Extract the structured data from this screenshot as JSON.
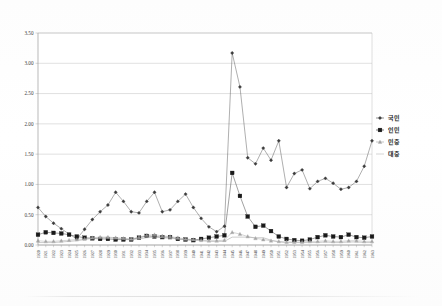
{
  "figure": {
    "title": "",
    "background_color": "#ffffff"
  },
  "axes": {
    "y_ticks": [
      "0.00",
      "0.50",
      "1.00",
      "1.50",
      "2.00",
      "2.50",
      "3.00",
      "3.50"
    ],
    "x_ticks": [
      "1920",
      "1921",
      "1922",
      "1923",
      "1924",
      "1925",
      "1926",
      "1927",
      "1928",
      "1929",
      "1930",
      "1931",
      "1932",
      "1933",
      "1934",
      "1935",
      "1936",
      "1937",
      "1938",
      "1939",
      "1940",
      "1941",
      "1942",
      "1943",
      "1944",
      "1945",
      "1946",
      "1947",
      "1948",
      "1949",
      "1950",
      "1951",
      "1952",
      "1953",
      "1954",
      "1955",
      "1956",
      "1957",
      "1958",
      "1959",
      "1960",
      "1961",
      "1962",
      "1963"
    ]
  },
  "legend": {
    "position": "right",
    "entries": [
      {
        "label": "국민",
        "marker": "diamond",
        "color": "#3c3c3c"
      },
      {
        "label": "인민",
        "marker": "square",
        "color": "#1a1a1a"
      },
      {
        "label": "민중",
        "marker": "triangle",
        "color": "#9a9a9a"
      },
      {
        "label": "대중",
        "marker": "line",
        "color": "#b4b4b4"
      }
    ]
  },
  "chart_data": {
    "type": "line",
    "title": "",
    "xlabel": "",
    "ylabel": "",
    "ylim": [
      0.0,
      3.5
    ],
    "ytick_step": 0.5,
    "grid": true,
    "legend_position": "right",
    "x": [
      "1920",
      "1921",
      "1922",
      "1923",
      "1924",
      "1925",
      "1926",
      "1927",
      "1928",
      "1929",
      "1930",
      "1931",
      "1932",
      "1933",
      "1934",
      "1935",
      "1936",
      "1937",
      "1938",
      "1939",
      "1940",
      "1941",
      "1942",
      "1943",
      "1944",
      "1945",
      "1946",
      "1947",
      "1948",
      "1949",
      "1950",
      "1951",
      "1952",
      "1953",
      "1954",
      "1955",
      "1956",
      "1957",
      "1958",
      "1959",
      "1960",
      "1961",
      "1962",
      "1963"
    ],
    "series": [
      {
        "name": "국민",
        "marker": "diamond",
        "color": "#3c3c3c",
        "values": [
          0.62,
          0.47,
          0.36,
          0.27,
          0.18,
          0.1,
          0.26,
          0.42,
          0.55,
          0.66,
          0.87,
          0.72,
          0.55,
          0.53,
          0.72,
          0.87,
          0.55,
          0.58,
          0.72,
          0.84,
          0.62,
          0.44,
          0.3,
          0.22,
          0.31,
          3.17,
          2.61,
          1.44,
          1.34,
          1.6,
          1.4,
          1.72,
          0.95,
          1.18,
          1.24,
          0.93,
          1.05,
          1.1,
          1.02,
          0.92,
          0.95,
          1.05,
          1.3,
          1.72
        ]
      },
      {
        "name": "인민",
        "marker": "square",
        "color": "#1a1a1a",
        "values": [
          0.17,
          0.21,
          0.2,
          0.19,
          0.17,
          0.14,
          0.12,
          0.11,
          0.1,
          0.1,
          0.09,
          0.09,
          0.09,
          0.12,
          0.15,
          0.14,
          0.13,
          0.13,
          0.1,
          0.09,
          0.08,
          0.1,
          0.12,
          0.14,
          0.16,
          1.19,
          0.81,
          0.47,
          0.3,
          0.32,
          0.23,
          0.14,
          0.1,
          0.08,
          0.07,
          0.09,
          0.13,
          0.16,
          0.14,
          0.13,
          0.17,
          0.13,
          0.12,
          0.14
        ]
      },
      {
        "name": "민중",
        "marker": "triangle",
        "color": "#9a9a9a",
        "values": [
          0.07,
          0.06,
          0.06,
          0.07,
          0.08,
          0.09,
          0.1,
          0.12,
          0.13,
          0.13,
          0.12,
          0.11,
          0.1,
          0.13,
          0.16,
          0.17,
          0.15,
          0.14,
          0.12,
          0.1,
          0.09,
          0.08,
          0.07,
          0.07,
          0.08,
          0.21,
          0.18,
          0.14,
          0.11,
          0.09,
          0.07,
          0.06,
          0.05,
          0.05,
          0.05,
          0.06,
          0.06,
          0.07,
          0.06,
          0.06,
          0.07,
          0.07,
          0.06,
          0.06
        ]
      },
      {
        "name": "대중",
        "marker": "line",
        "color": "#b4b4b4",
        "values": [
          0.04,
          0.04,
          0.04,
          0.05,
          0.06,
          0.07,
          0.09,
          0.11,
          0.12,
          0.12,
          0.11,
          0.1,
          0.09,
          0.1,
          0.12,
          0.13,
          0.12,
          0.11,
          0.1,
          0.09,
          0.08,
          0.07,
          0.06,
          0.06,
          0.06,
          0.13,
          0.13,
          0.13,
          0.12,
          0.12,
          0.08,
          0.05,
          0.04,
          0.04,
          0.04,
          0.04,
          0.04,
          0.05,
          0.04,
          0.04,
          0.05,
          0.05,
          0.04,
          0.04
        ]
      }
    ]
  }
}
